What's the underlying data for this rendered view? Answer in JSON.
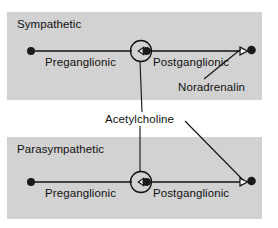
{
  "figure": {
    "kind": "autonomic-nervous-system-neurotransmitter-diagram",
    "background_color": "#ffffff",
    "panel_color": "#d2d2d2",
    "ink_color": "#111111"
  },
  "panels": [
    {
      "id": "sympathetic",
      "title": "Sympathetic",
      "neurons": [
        {
          "id": "preganglionic",
          "label": "Preganglionic"
        },
        {
          "id": "postganglionic",
          "label": "Postganglionic"
        }
      ],
      "transmitters": [
        {
          "id": "ganglion-synapse",
          "label": "Acetylcholine"
        },
        {
          "id": "effector-synapse",
          "label": "Noradrenalin"
        }
      ]
    },
    {
      "id": "parasympathetic",
      "title": "Parasympathetic",
      "neurons": [
        {
          "id": "preganglionic",
          "label": "Preganglionic"
        },
        {
          "id": "postganglionic",
          "label": "Postganglionic"
        }
      ],
      "transmitters": [
        {
          "id": "ganglion-synapse",
          "label": "Acetylcholine"
        },
        {
          "id": "effector-synapse",
          "label": "Acetylcholine"
        }
      ]
    }
  ],
  "labels": {
    "sympathetic_title": "Sympathetic",
    "parasympathetic_title": "Parasympathetic",
    "preganglionic_sym": "Preganglionic",
    "postganglionic_sym": "Postganglionic",
    "preganglionic_para": "Preganglionic",
    "postganglionic_para": "Postganglionic",
    "noradrenalin": "Noradrenalin",
    "acetylcholine": "Acetylcholine"
  },
  "icons": {
    "cell_body": "filled-circle-soma-icon",
    "ganglion": "ganglion-circle-icon",
    "synapse_arrowhead": "open-triangle-synapse-icon",
    "terminal": "filled-circle-terminal-icon",
    "leader": "leader-line"
  }
}
